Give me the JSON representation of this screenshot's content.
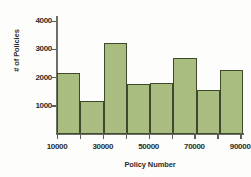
{
  "chart_data": {
    "type": "bar",
    "title": "",
    "subtitle": "",
    "xlabel": "Policy Number",
    "ylabel": "# of Policies",
    "categories": [
      "10000-20000",
      "20000-30000",
      "30000-40000",
      "40000-50000",
      "50000-60000",
      "60000-70000",
      "70000-80000",
      "80000-90000"
    ],
    "bin_edges": [
      10000,
      20000,
      30000,
      40000,
      50000,
      60000,
      70000,
      80000,
      90000
    ],
    "values": [
      2260,
      1220,
      3400,
      1880,
      1900,
      2830,
      1650,
      2370
    ],
    "xlim": [
      10000,
      90000
    ],
    "ylim": [
      0,
      4400
    ],
    "x_ticks": [
      10000,
      30000,
      50000,
      70000,
      90000
    ],
    "x_tick_labels": [
      "10000",
      "30000",
      "50000",
      "70000",
      "90000"
    ],
    "x_minor_ticks": [
      20000,
      40000,
      60000,
      80000
    ],
    "y_ticks": [
      1000,
      2000,
      3000,
      4000
    ],
    "y_tick_labels": [
      "1000",
      "2000",
      "3000",
      "4000"
    ],
    "grid": false,
    "legend": null,
    "legend_position": "none",
    "bar_color": "#a8bd7f",
    "bar_edge_color": "#3f4a2c",
    "axis_color": "#6e6e68",
    "text_color": "#2b2b2b",
    "background": "#fdfdfb"
  }
}
